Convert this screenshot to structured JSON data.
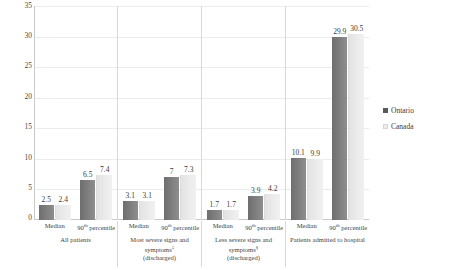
{
  "chart_data": {
    "type": "bar",
    "title": "",
    "xlabel": "",
    "ylabel": "",
    "ylim": [
      0,
      35
    ],
    "yticks": [
      0,
      5,
      10,
      15,
      20,
      25,
      30,
      35
    ],
    "grid": true,
    "legend_position": "right",
    "categories": [
      "All patients – Median",
      "All patients – 90th percentile",
      "Most severe signs and symptoms (discharged) – Median",
      "Most severe signs and symptoms (discharged) – 90th percentile",
      "Less severe signs and symptoms (discharged) – Median",
      "Less severe signs and symptoms (discharged) – 90th percentile",
      "Patients admitted to hospital – Median",
      "Patients admitted to hospital – 90th percentile"
    ],
    "series": [
      {
        "name": "Ontario",
        "color": "#7a7a7a",
        "values": [
          2.5,
          6.5,
          3.1,
          7,
          1.7,
          3.9,
          10.1,
          29.9
        ]
      },
      {
        "name": "Canada",
        "color": "#ececec",
        "values": [
          2.4,
          7.4,
          3.1,
          7.3,
          1.7,
          4.2,
          9.9,
          30.5
        ]
      }
    ],
    "groups": [
      {
        "title": "All patients",
        "title_marker": "",
        "subgroups": [
          {
            "label": "Median",
            "marker": "",
            "ontario": "2.5",
            "canada": "2.4",
            "ontario_value": 2.5,
            "canada_value": 2.4
          },
          {
            "label": "90",
            "marker": "th",
            "label_suffix": " percentile",
            "ontario": "6.5",
            "canada": "7.4",
            "ontario_value": 6.5,
            "canada_value": 7.4
          }
        ]
      },
      {
        "title": "Most severe signs and symptoms",
        "title_marker": "‡",
        "title_second_line": "(discharged)",
        "subgroups": [
          {
            "label": "Median",
            "marker": "",
            "ontario": "3.1",
            "canada": "3.1",
            "ontario_value": 3.1,
            "canada_value": 3.1
          },
          {
            "label": "90",
            "marker": "th",
            "label_suffix": " percentile",
            "ontario": "7",
            "canada": "7.3",
            "ontario_value": 7,
            "canada_value": 7.3
          }
        ]
      },
      {
        "title": "Less severe signs and symptoms",
        "title_marker": "§",
        "title_second_line": "(discharged)",
        "subgroups": [
          {
            "label": "Median",
            "marker": "",
            "ontario": "1.7",
            "canada": "1.7",
            "ontario_value": 1.7,
            "canada_value": 1.7
          },
          {
            "label": "90",
            "marker": "th",
            "label_suffix": " percentile",
            "ontario": "3.9",
            "canada": "4.2",
            "ontario_value": 3.9,
            "canada_value": 4.2
          }
        ]
      },
      {
        "title": "Patients admitted to hospital",
        "title_marker": "",
        "subgroups": [
          {
            "label": "Median",
            "marker": "",
            "ontario": "10.1",
            "canada": "9.9",
            "ontario_value": 10.1,
            "canada_value": 9.9
          },
          {
            "label": "90",
            "marker": "th",
            "label_suffix": " percentile",
            "ontario": "29.9",
            "canada": "30.5",
            "ontario_value": 29.9,
            "canada_value": 30.5
          }
        ]
      }
    ]
  },
  "axis": {
    "y": {
      "t0": "0",
      "t5": "5",
      "t10": "10",
      "t15": "15",
      "t20": "20",
      "t25": "25",
      "t30": "30",
      "t35": "35"
    }
  },
  "legend": {
    "items": [
      {
        "label": "Ontario",
        "color": "#595959"
      },
      {
        "label": "Canada",
        "color": "#ededed"
      }
    ]
  }
}
